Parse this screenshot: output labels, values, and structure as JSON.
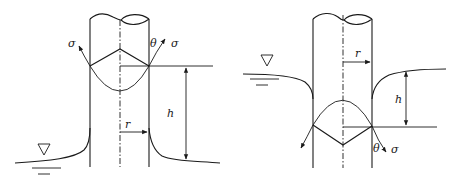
{
  "figure": {
    "type": "capillary-tube-diagrams",
    "panels": [
      {
        "id": "capillary-rise",
        "labels": {
          "sigma_left": "σ",
          "theta": "θ",
          "sigma_right": "σ",
          "height": "h",
          "radius": "r"
        },
        "water_level_symbol": "∇"
      },
      {
        "id": "capillary-depression",
        "labels": {
          "theta": "θ",
          "sigma": "σ",
          "height": "h",
          "radius": "r"
        },
        "water_level_symbol": "∇"
      }
    ]
  }
}
